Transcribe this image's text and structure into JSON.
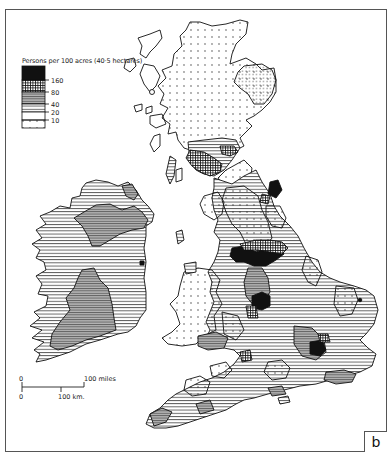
{
  "figure": {
    "label": "b",
    "legend": {
      "title": "Persons per 100 acres (40·5 hectares)",
      "classes": [
        {
          "pattern": "solid-black",
          "range": "over 160"
        },
        {
          "pattern": "dense-grid",
          "range": "80–160"
        },
        {
          "pattern": "grey-hatch",
          "range": "40–80"
        },
        {
          "pattern": "horizontal-lines",
          "range": "20–40"
        },
        {
          "pattern": "open-lines",
          "range": "10–20"
        },
        {
          "pattern": "dots",
          "range": "under 10"
        }
      ],
      "tick_labels": [
        "160",
        "80",
        "40",
        "20",
        "10"
      ]
    },
    "scale_bar": {
      "miles_zero": "0",
      "miles_label": "100 miles",
      "km_zero": "0",
      "km_label": "100 km."
    },
    "regions": [
      "Scotland",
      "England",
      "Wales",
      "Ireland"
    ],
    "colors": {
      "ink": "#111111",
      "grey": "#8a8a8a",
      "paper": "#ffffff",
      "frame": "#555555"
    }
  }
}
